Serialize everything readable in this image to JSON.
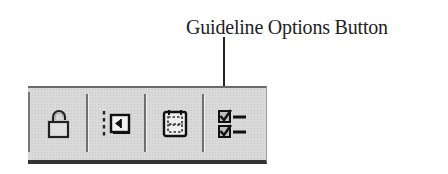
{
  "callout": {
    "label": "Guideline Options Button",
    "target": "guideline-options-button"
  },
  "toolbar": {
    "buttons": [
      {
        "id": "lock",
        "icon": "padlock-icon",
        "label": "Lock"
      },
      {
        "id": "margin",
        "icon": "margin-guide-icon",
        "label": "Margin Guide"
      },
      {
        "id": "grid",
        "icon": "grid-frame-icon",
        "label": "Grid Frame"
      },
      {
        "id": "guideline-options",
        "icon": "checklist-icon",
        "label": "Guideline Options"
      }
    ]
  },
  "colors": {
    "toolbar_bg": "#d9d9d9",
    "border_dark": "#333333",
    "icon": "#222222"
  }
}
